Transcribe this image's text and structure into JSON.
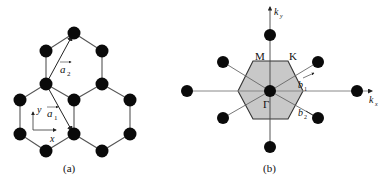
{
  "panels": [
    {
      "id": "a",
      "caption": "(a)",
      "description": "Honeycomb (graphene) real-space lattice with primitive vectors",
      "vectors": [
        {
          "name": "a1",
          "label": "a",
          "subscript": "1"
        },
        {
          "name": "a2",
          "label": "a",
          "subscript": "2"
        }
      ],
      "axes": {
        "x": "x",
        "y": "y"
      }
    },
    {
      "id": "b",
      "caption": "(b)",
      "description": "Reciprocal lattice with first Brillouin zone (shaded hexagon)",
      "axes": {
        "kx": "k",
        "kx_sub": "x",
        "ky": "k",
        "ky_sub": "y"
      },
      "points": {
        "gamma": "Γ",
        "M": "M",
        "K": "K"
      },
      "vectors": [
        {
          "name": "b1",
          "label": "b",
          "subscript": "1"
        },
        {
          "name": "b2",
          "label": "b",
          "subscript": "2"
        }
      ]
    }
  ],
  "colors": {
    "atom": "#0a0a0a",
    "bond": "#555555",
    "zone_fill": "#c8c8c8",
    "zone_stroke": "#333333",
    "axis": "#777777"
  }
}
